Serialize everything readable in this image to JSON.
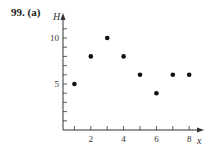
{
  "problem": {
    "number": "99.",
    "part": "(a)"
  },
  "chart_data": {
    "type": "scatter",
    "title": "",
    "xlabel": "x",
    "ylabel": "H",
    "x": [
      1,
      2,
      3,
      4,
      5,
      6,
      7,
      8
    ],
    "y": [
      5,
      8,
      10,
      8,
      6,
      4,
      6,
      6
    ],
    "xticks": [
      1,
      2,
      3,
      4,
      5,
      6,
      7,
      8
    ],
    "xtick_labels": [
      "2",
      "4",
      "6",
      "8"
    ],
    "yticks": [
      1,
      2,
      3,
      4,
      5,
      6,
      7,
      8,
      9,
      10,
      11
    ],
    "ytick_labels": [
      "5",
      "10"
    ],
    "xlim": [
      0,
      8.8
    ],
    "ylim": [
      0,
      12
    ],
    "grid": false,
    "legend": null
  },
  "colors": {
    "point": "#111111",
    "axis": "#333333"
  }
}
